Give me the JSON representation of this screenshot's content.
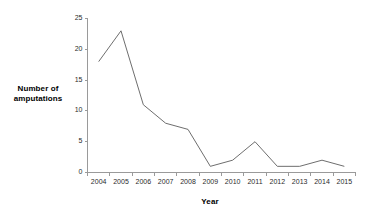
{
  "chart_data": {
    "type": "line",
    "title": "",
    "xlabel": "Year",
    "ylabel": "Number of amputations",
    "categories": [
      "2004",
      "2005",
      "2006",
      "2007",
      "2008",
      "2009",
      "2010",
      "2011",
      "2012",
      "2013",
      "2014",
      "2015"
    ],
    "values": [
      18,
      23,
      11,
      8,
      7,
      1,
      2,
      5,
      1,
      1,
      2,
      1
    ],
    "series": [
      {
        "name": "Number of amputations",
        "values": [
          18,
          23,
          11,
          8,
          7,
          1,
          2,
          5,
          1,
          1,
          2,
          1
        ]
      }
    ],
    "ylim": [
      0,
      25
    ],
    "y_ticks": [
      0,
      5,
      10,
      15,
      20,
      25
    ],
    "y_tick_labels": [
      "0",
      "5",
      "10",
      "15",
      "20",
      "25"
    ],
    "grid": false,
    "legend": false,
    "legend_position": "none",
    "line_color": "#6e6e6e",
    "axis_color": "#9a9a9a",
    "background_color": "#ffffff"
  },
  "labels": {
    "y_axis_title_line1": "Number of",
    "y_axis_title_line2": "amputations",
    "x_axis_title": "Year"
  }
}
